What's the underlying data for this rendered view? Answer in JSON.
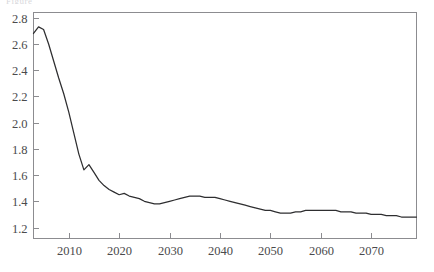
{
  "figure": {
    "title_fragment": "Figure",
    "background_color": "#ffffff",
    "line_color": "#2e2e30",
    "axis_color": "#8c8c90"
  },
  "chart_data": {
    "type": "line",
    "title": "",
    "subtitle": "",
    "xlabel": "",
    "ylabel": "",
    "xlim": [
      2003,
      2079
    ],
    "ylim": [
      1.12,
      2.84
    ],
    "grid": false,
    "legend": null,
    "xticks": [
      2010,
      2020,
      2030,
      2040,
      2050,
      2060,
      2070
    ],
    "xtick_labels": [
      "2010",
      "2020",
      "2030",
      "2040",
      "2050",
      "2060",
      "2070"
    ],
    "yticks": [
      1.2,
      1.4,
      1.6,
      1.8,
      2.0,
      2.2,
      2.4,
      2.6,
      2.8
    ],
    "ytick_labels": [
      "1.2",
      "1.4",
      "1.6",
      "1.8",
      "2.0",
      "2.2",
      "2.4",
      "2.6",
      "2.8"
    ],
    "series": [
      {
        "name": "total fertility rate",
        "x": [
          2003,
          2004,
          2005,
          2006,
          2007,
          2008,
          2009,
          2010,
          2011,
          2012,
          2013,
          2014,
          2015,
          2016,
          2017,
          2018,
          2019,
          2020,
          2021,
          2022,
          2023,
          2024,
          2025,
          2026,
          2027,
          2028,
          2029,
          2030,
          2031,
          2032,
          2033,
          2034,
          2035,
          2036,
          2037,
          2038,
          2039,
          2040,
          2041,
          2042,
          2043,
          2044,
          2045,
          2046,
          2047,
          2048,
          2049,
          2050,
          2051,
          2052,
          2053,
          2054,
          2055,
          2056,
          2057,
          2058,
          2059,
          2060,
          2061,
          2062,
          2063,
          2064,
          2065,
          2066,
          2067,
          2068,
          2069,
          2070,
          2071,
          2072,
          2073,
          2074,
          2075,
          2076,
          2077,
          2078,
          2079
        ],
        "y": [
          2.68,
          2.73,
          2.71,
          2.6,
          2.47,
          2.34,
          2.22,
          2.08,
          1.92,
          1.76,
          1.64,
          1.68,
          1.62,
          1.56,
          1.52,
          1.49,
          1.47,
          1.45,
          1.46,
          1.44,
          1.43,
          1.42,
          1.4,
          1.39,
          1.38,
          1.38,
          1.39,
          1.4,
          1.41,
          1.42,
          1.43,
          1.44,
          1.44,
          1.44,
          1.43,
          1.43,
          1.43,
          1.42,
          1.41,
          1.4,
          1.39,
          1.38,
          1.37,
          1.36,
          1.35,
          1.34,
          1.33,
          1.33,
          1.32,
          1.31,
          1.31,
          1.31,
          1.32,
          1.32,
          1.33,
          1.33,
          1.33,
          1.33,
          1.33,
          1.33,
          1.33,
          1.32,
          1.32,
          1.32,
          1.31,
          1.31,
          1.31,
          1.3,
          1.3,
          1.3,
          1.29,
          1.29,
          1.29,
          1.28,
          1.28,
          1.28,
          1.28
        ]
      }
    ]
  }
}
